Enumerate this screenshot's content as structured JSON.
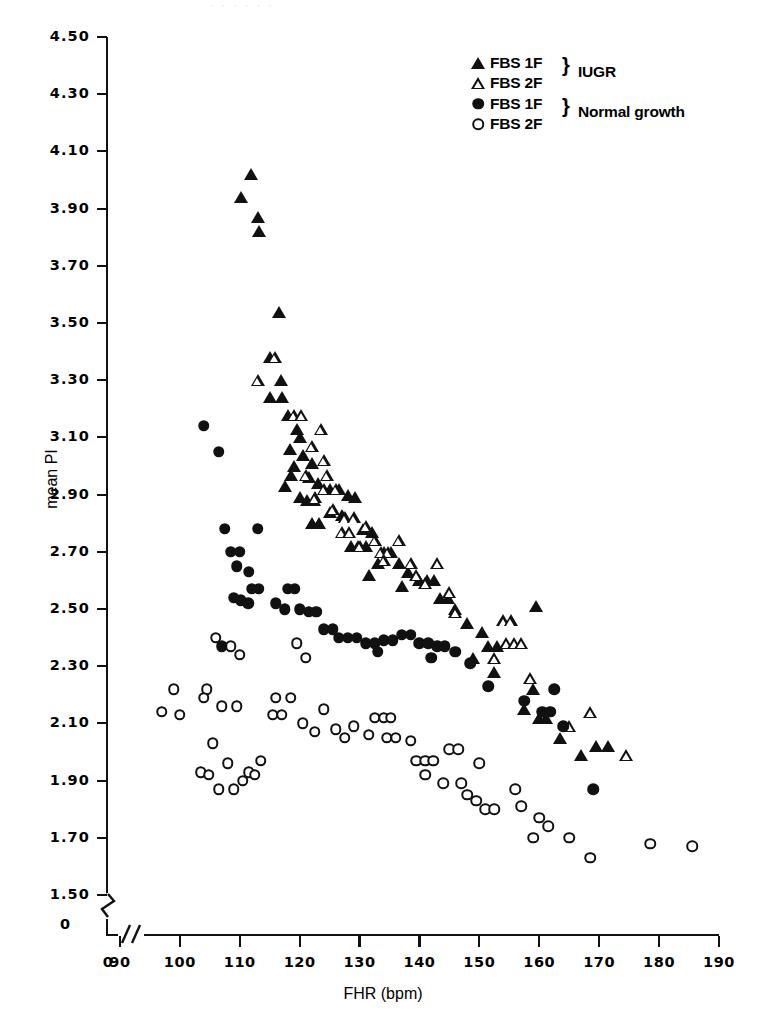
{
  "chart_data": {
    "type": "scatter",
    "title": "",
    "xlabel": "FHR (bpm)",
    "ylabel": "mean PI",
    "xlim": [
      88,
      190
    ],
    "ylim": [
      1.45,
      4.52
    ],
    "xticks": [
      0,
      90,
      100,
      110,
      120,
      130,
      140,
      150,
      160,
      170,
      180,
      190
    ],
    "yticks": [
      4.5,
      4.3,
      4.1,
      3.9,
      3.7,
      3.5,
      3.3,
      3.1,
      2.9,
      2.7,
      2.5,
      2.3,
      2.1,
      1.9,
      1.7,
      1.5,
      0
    ],
    "ytick_labels": [
      "4.50",
      "4.30",
      "4.10",
      "3.90",
      "3.70",
      "3.50",
      "3.30",
      "3.10",
      "2.90",
      "2.70",
      "2.50",
      "2.30",
      "2.10",
      "1.90",
      "1.70",
      "1.50",
      "0"
    ],
    "xtick_labels": [
      "0",
      "90",
      "100",
      "110",
      "120",
      "130",
      "140",
      "150",
      "160",
      "170",
      "180",
      "190"
    ],
    "axis_break_x": true,
    "axis_break_y": true,
    "grid": false,
    "legend_position": "top-right",
    "series": [
      {
        "name": "FBS 1F",
        "group": "IUGR",
        "marker": "tri-filled",
        "points": [
          [
            111.8,
            4.02
          ],
          [
            110.2,
            3.94
          ],
          [
            113.0,
            3.87
          ],
          [
            113.2,
            3.82
          ],
          [
            116.5,
            3.54
          ],
          [
            115.0,
            3.38
          ],
          [
            116.8,
            3.3
          ],
          [
            115.0,
            3.24
          ],
          [
            117.0,
            3.24
          ],
          [
            118.0,
            3.18
          ],
          [
            119.5,
            3.13
          ],
          [
            120.0,
            3.1
          ],
          [
            118.3,
            3.06
          ],
          [
            120.5,
            3.04
          ],
          [
            119.0,
            3.0
          ],
          [
            122.0,
            3.01
          ],
          [
            118.5,
            2.97
          ],
          [
            121.5,
            2.96
          ],
          [
            123.0,
            2.94
          ],
          [
            117.5,
            2.93
          ],
          [
            125.0,
            2.92
          ],
          [
            126.5,
            2.92
          ],
          [
            120.0,
            2.89
          ],
          [
            121.2,
            2.88
          ],
          [
            122.4,
            2.88
          ],
          [
            128.0,
            2.9
          ],
          [
            129.2,
            2.89
          ],
          [
            125.0,
            2.84
          ],
          [
            127.0,
            2.83
          ],
          [
            122.0,
            2.8
          ],
          [
            123.2,
            2.8
          ],
          [
            130.5,
            2.78
          ],
          [
            132.0,
            2.77
          ],
          [
            128.5,
            2.72
          ],
          [
            129.7,
            2.72
          ],
          [
            131.0,
            2.72
          ],
          [
            134.0,
            2.7
          ],
          [
            135.2,
            2.7
          ],
          [
            133.0,
            2.66
          ],
          [
            136.5,
            2.66
          ],
          [
            131.5,
            2.62
          ],
          [
            138.0,
            2.63
          ],
          [
            140.0,
            2.6
          ],
          [
            141.3,
            2.6
          ],
          [
            142.5,
            2.6
          ],
          [
            137.0,
            2.58
          ],
          [
            143.5,
            2.54
          ],
          [
            144.8,
            2.54
          ],
          [
            146.0,
            2.5
          ],
          [
            159.5,
            2.51
          ],
          [
            148.0,
            2.45
          ],
          [
            150.5,
            2.42
          ],
          [
            151.5,
            2.37
          ],
          [
            153.0,
            2.37
          ],
          [
            149.0,
            2.33
          ],
          [
            152.5,
            2.28
          ],
          [
            159.0,
            2.22
          ],
          [
            157.5,
            2.15
          ],
          [
            160.0,
            2.12
          ],
          [
            161.2,
            2.12
          ],
          [
            163.5,
            2.05
          ],
          [
            169.5,
            2.02
          ],
          [
            171.5,
            2.02
          ],
          [
            167.0,
            1.99
          ]
        ]
      },
      {
        "name": "FBS 2F",
        "group": "IUGR",
        "marker": "tri-open",
        "points": [
          [
            115.8,
            3.38
          ],
          [
            113.0,
            3.3
          ],
          [
            119.0,
            3.18
          ],
          [
            120.2,
            3.18
          ],
          [
            123.5,
            3.13
          ],
          [
            122.0,
            3.07
          ],
          [
            124.0,
            3.02
          ],
          [
            121.0,
            2.97
          ],
          [
            124.5,
            2.97
          ],
          [
            124.0,
            2.92
          ],
          [
            126.0,
            2.92
          ],
          [
            122.5,
            2.89
          ],
          [
            125.5,
            2.85
          ],
          [
            127.5,
            2.82
          ],
          [
            129.0,
            2.82
          ],
          [
            131.0,
            2.79
          ],
          [
            127.0,
            2.77
          ],
          [
            128.2,
            2.77
          ],
          [
            132.5,
            2.74
          ],
          [
            136.5,
            2.74
          ],
          [
            130.0,
            2.72
          ],
          [
            133.5,
            2.7
          ],
          [
            134.7,
            2.7
          ],
          [
            134.0,
            2.67
          ],
          [
            138.5,
            2.66
          ],
          [
            143.0,
            2.66
          ],
          [
            139.5,
            2.62
          ],
          [
            141.0,
            2.59
          ],
          [
            145.0,
            2.56
          ],
          [
            146.0,
            2.49
          ],
          [
            154.0,
            2.46
          ],
          [
            155.2,
            2.46
          ],
          [
            154.5,
            2.38
          ],
          [
            155.8,
            2.38
          ],
          [
            157.0,
            2.38
          ],
          [
            152.5,
            2.33
          ],
          [
            158.5,
            2.26
          ],
          [
            168.5,
            2.14
          ],
          [
            165.0,
            2.09
          ],
          [
            174.5,
            1.99
          ]
        ]
      },
      {
        "name": "FBS 1F",
        "group": "Normal growth",
        "marker": "circle-filled",
        "points": [
          [
            104.0,
            3.14
          ],
          [
            106.5,
            3.05
          ],
          [
            107.5,
            2.78
          ],
          [
            113.0,
            2.78
          ],
          [
            108.5,
            2.7
          ],
          [
            110.0,
            2.7
          ],
          [
            109.5,
            2.65
          ],
          [
            111.5,
            2.63
          ],
          [
            112.0,
            2.57
          ],
          [
            113.2,
            2.57
          ],
          [
            109.0,
            2.54
          ],
          [
            110.2,
            2.53
          ],
          [
            111.4,
            2.52
          ],
          [
            118.0,
            2.57
          ],
          [
            119.2,
            2.57
          ],
          [
            116.0,
            2.52
          ],
          [
            117.5,
            2.5
          ],
          [
            120.0,
            2.5
          ],
          [
            121.5,
            2.49
          ],
          [
            122.8,
            2.49
          ],
          [
            107.0,
            2.37
          ],
          [
            124.0,
            2.43
          ],
          [
            125.5,
            2.43
          ],
          [
            126.5,
            2.4
          ],
          [
            128.0,
            2.4
          ],
          [
            129.5,
            2.4
          ],
          [
            131.0,
            2.38
          ],
          [
            132.5,
            2.38
          ],
          [
            134.0,
            2.39
          ],
          [
            135.5,
            2.39
          ],
          [
            133.0,
            2.35
          ],
          [
            137.0,
            2.41
          ],
          [
            138.5,
            2.41
          ],
          [
            140.0,
            2.38
          ],
          [
            141.5,
            2.38
          ],
          [
            143.0,
            2.37
          ],
          [
            144.2,
            2.37
          ],
          [
            142.0,
            2.33
          ],
          [
            146.0,
            2.35
          ],
          [
            148.5,
            2.31
          ],
          [
            151.5,
            2.23
          ],
          [
            157.5,
            2.18
          ],
          [
            160.5,
            2.14
          ],
          [
            161.8,
            2.14
          ],
          [
            162.5,
            2.22
          ],
          [
            164.0,
            2.09
          ],
          [
            169.0,
            1.87
          ]
        ]
      },
      {
        "name": "FBS 2F",
        "group": "Normal growth",
        "marker": "circle-open",
        "points": [
          [
            97.0,
            2.14
          ],
          [
            100.0,
            2.13
          ],
          [
            99.0,
            2.22
          ],
          [
            104.5,
            2.22
          ],
          [
            106.0,
            2.4
          ],
          [
            108.5,
            2.37
          ],
          [
            110.0,
            2.34
          ],
          [
            104.0,
            2.19
          ],
          [
            107.0,
            2.16
          ],
          [
            109.5,
            2.16
          ],
          [
            105.5,
            2.03
          ],
          [
            108.0,
            1.96
          ],
          [
            103.5,
            1.93
          ],
          [
            104.8,
            1.92
          ],
          [
            106.5,
            1.87
          ],
          [
            109.0,
            1.87
          ],
          [
            111.5,
            1.93
          ],
          [
            112.5,
            1.92
          ],
          [
            113.5,
            1.97
          ],
          [
            110.5,
            1.9
          ],
          [
            115.5,
            2.13
          ],
          [
            117.0,
            2.13
          ],
          [
            116.0,
            2.19
          ],
          [
            118.5,
            2.19
          ],
          [
            119.5,
            2.38
          ],
          [
            121.0,
            2.33
          ],
          [
            120.5,
            2.1
          ],
          [
            122.5,
            2.07
          ],
          [
            124.0,
            2.15
          ],
          [
            126.0,
            2.08
          ],
          [
            127.5,
            2.05
          ],
          [
            129.0,
            2.09
          ],
          [
            131.5,
            2.06
          ],
          [
            132.5,
            2.12
          ],
          [
            134.0,
            2.12
          ],
          [
            135.2,
            2.12
          ],
          [
            134.5,
            2.05
          ],
          [
            136.0,
            2.05
          ],
          [
            138.5,
            2.04
          ],
          [
            139.5,
            1.97
          ],
          [
            141.0,
            1.97
          ],
          [
            142.3,
            1.97
          ],
          [
            141.0,
            1.92
          ],
          [
            144.0,
            1.89
          ],
          [
            147.0,
            1.89
          ],
          [
            148.0,
            1.85
          ],
          [
            149.5,
            1.83
          ],
          [
            151.0,
            1.8
          ],
          [
            152.5,
            1.8
          ],
          [
            156.0,
            1.87
          ],
          [
            157.0,
            1.81
          ],
          [
            160.0,
            1.77
          ],
          [
            161.5,
            1.74
          ],
          [
            159.0,
            1.7
          ],
          [
            165.0,
            1.7
          ],
          [
            168.5,
            1.63
          ],
          [
            178.5,
            1.68
          ],
          [
            185.5,
            1.67
          ],
          [
            145.0,
            2.01
          ],
          [
            146.5,
            2.01
          ],
          [
            150.0,
            1.96
          ]
        ]
      }
    ]
  },
  "legend": {
    "rows": [
      {
        "marker": "tri-filled",
        "label": "FBS 1F"
      },
      {
        "marker": "tri-open",
        "label": "FBS 2F"
      },
      {
        "marker": "circle-filled",
        "label": "FBS 1F"
      },
      {
        "marker": "circle-open",
        "label": "FBS 2F"
      }
    ],
    "brace": "}",
    "group_iugr": "IUGR",
    "group_normal": "Normal growth"
  },
  "axes": {
    "x_title": "FHR (bpm)",
    "y_title": "mean PI",
    "y_zero_label": "0"
  },
  "colors": {
    "ink": "#111111",
    "background": "#ffffff"
  }
}
